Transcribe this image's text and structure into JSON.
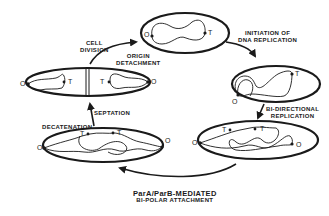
{
  "diagram": {
    "type": "cell-cycle",
    "stages": [
      {
        "id": "newborn-cell",
        "markers": [
          "O",
          "T"
        ]
      },
      {
        "id": "replication-initiated",
        "markers": [
          "O",
          "T"
        ]
      },
      {
        "id": "bidirectional-replication",
        "markers": [
          "O",
          "T",
          "T",
          "O"
        ]
      },
      {
        "id": "decatenation-cell",
        "markers": [
          "O",
          "T",
          "T",
          "O"
        ]
      },
      {
        "id": "septated-cell",
        "markers": [
          "O",
          "T",
          "T",
          "O"
        ]
      }
    ],
    "transitions": [
      {
        "from": "newborn-cell",
        "to": "replication-initiated",
        "label": "INITIATION OF DNA REPLICATION"
      },
      {
        "from": "replication-initiated",
        "to": "bidirectional-replication",
        "label": "BI-DIRECTIONAL REPLICATION"
      },
      {
        "from": "bidirectional-replication",
        "to": "decatenation-cell",
        "label": "ParA/ParB-MEDIATED BI-POLAR ATTACHMENT"
      },
      {
        "from": "decatenation-cell",
        "to": "septated-cell",
        "label": "SEPTATION"
      },
      {
        "from": "septated-cell",
        "to": "newborn-cell",
        "label": "CELL DIVISION / ORIGIN DETACHMENT"
      }
    ]
  },
  "labels": {
    "cell_division_line1": "CELL",
    "cell_division_line2": "DIVISION",
    "origin_detachment_line1": "ORIGIN",
    "origin_detachment_line2": "DETACHMENT",
    "initiation_line1": "INITIATION OF",
    "initiation_line2": "DNA REPLICATION",
    "bidirectional_line1": "BI-DIRECTIONAL",
    "bidirectional_line2": "REPLICATION",
    "para_parb_line1": "ParA/ParB-MEDIATED",
    "para_parb_line2": "BI-POLAR ATTACHMENT",
    "septation": "SEPTATION",
    "decatenation": "DECATENATION"
  },
  "markers": {
    "origin": "O",
    "terminus": "T"
  },
  "colors": {
    "ink": "#1a1a1a",
    "background": "#ffffff"
  }
}
